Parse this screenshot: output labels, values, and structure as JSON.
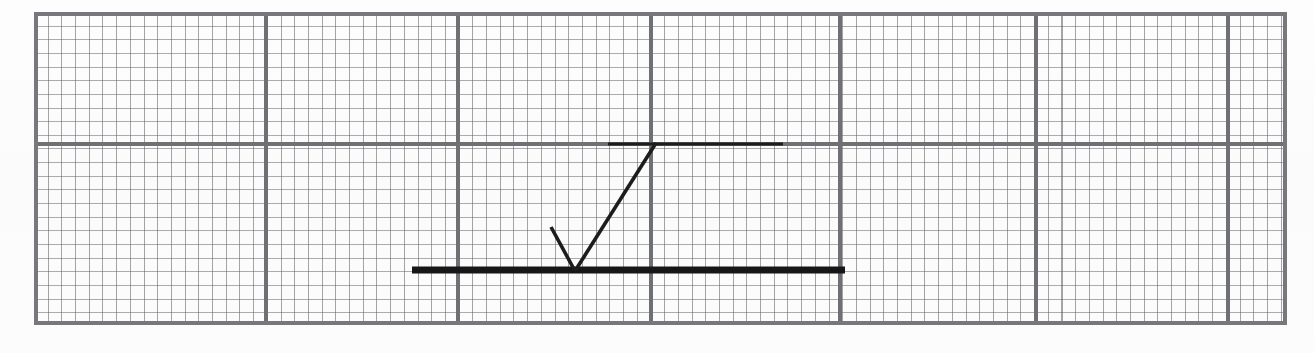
{
  "document": {
    "kind": "scanned-graph-paper",
    "title": "Hand-drawn ray reflection diagram on millimetre graph paper",
    "paper_color": "#fcfcfc",
    "ink_color": "#1d1d1d",
    "grid_minor_color": "#5c5c60",
    "grid_major_color": "#6f7073",
    "width": 1314,
    "height": 353
  },
  "grid": {
    "left": 34,
    "top": 12,
    "right": 1287,
    "bottom": 325,
    "minor_cell_px": 13.7,
    "major_every_cells": 14,
    "major_vertical_x": [
      266,
      458,
      651,
      840,
      1036,
      1228
    ],
    "major_horizontal_y": [
      144
    ],
    "border_lines": [
      "top",
      "bottom",
      "left",
      "right"
    ]
  },
  "drawing": {
    "strokes": [
      {
        "name": "reflecting-surface-line",
        "role": "thick horizontal surface / mirror",
        "type": "line",
        "x1": 412,
        "y1": 270,
        "x2": 845,
        "y2": 270,
        "width": 7,
        "color": "#141414"
      },
      {
        "name": "upper-reference-line",
        "role": "thin horizontal reference line",
        "type": "line",
        "x1": 608,
        "y1": 144,
        "x2": 783,
        "y2": 144,
        "width": 3,
        "color": "#1d1d1d"
      },
      {
        "name": "incident-ray",
        "role": "short ray descending to the point of incidence",
        "type": "line",
        "x1": 551,
        "y1": 227,
        "x2": 575,
        "y2": 271,
        "width": 3.6,
        "color": "#1d1d1d"
      },
      {
        "name": "reflected-ray",
        "role": "long ray ascending from the point of incidence",
        "type": "line",
        "x1": 575,
        "y1": 271,
        "x2": 656,
        "y2": 143,
        "width": 3.6,
        "color": "#1d1d1d"
      }
    ],
    "vertex": {
      "name": "point-of-incidence",
      "x": 575,
      "y": 271
    }
  }
}
